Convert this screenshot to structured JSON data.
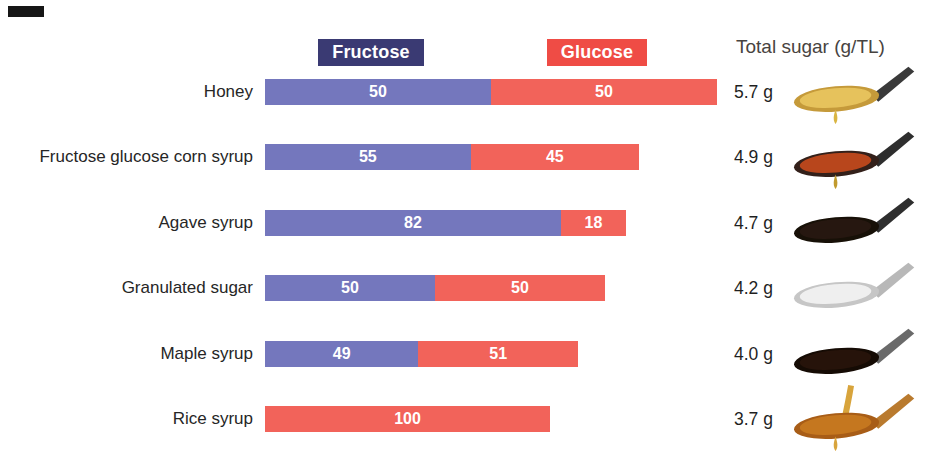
{
  "legend": {
    "fructose_label": "Fructose",
    "glucose_label": "Glucose"
  },
  "header": {
    "total_sugar_label": "Total sugar (g/TL)"
  },
  "colors": {
    "background": "#ffffff",
    "bar_fructose": "#7477bd",
    "bar_glucose": "#f2635a",
    "legend_fructose": "#3a3a73",
    "legend_glucose": "#ef4c45",
    "bar_value_text": "#ffffff",
    "category_text": "#262626",
    "total_text": "#1f1f1f",
    "header_text": "#474340"
  },
  "chart_data": {
    "type": "bar",
    "variant": "horizontal-stacked-100pct",
    "title": "",
    "legend_entries": [
      "Fructose",
      "Glucose"
    ],
    "legend_position": "top",
    "grid": false,
    "unit": "percent of sugar composition",
    "categories": [
      "Honey",
      "Fructose glucose corn syrup",
      "Agave syrup",
      "Granulated sugar",
      "Maple syrup",
      "Rice syrup"
    ],
    "series": [
      {
        "name": "Fructose",
        "values": [
          50,
          55,
          82,
          50,
          49,
          0
        ]
      },
      {
        "name": "Glucose",
        "values": [
          50,
          45,
          18,
          50,
          51,
          100
        ]
      }
    ],
    "totals": {
      "label": "Total sugar (g/TL)",
      "values": [
        5.7,
        4.9,
        4.7,
        4.2,
        4.0,
        3.7
      ]
    },
    "bar_width_note": "bar total length is proportional to total sugar per teaspoon",
    "rows": [
      {
        "label": "Honey",
        "fructose": 50,
        "glucose": 50,
        "fructose_label": "50",
        "glucose_label": "50",
        "total_label": "5.7 g",
        "spoon": "honey-spoon",
        "spoon_colors": {
          "pour": null,
          "handle": "#3a3a3a",
          "rim": "#c59a3a",
          "content": "#e6c25c",
          "drip": "#d9b542"
        }
      },
      {
        "label": "Fructose glucose corn syrup",
        "fructose": 55,
        "glucose": 45,
        "fructose_label": "55",
        "glucose_label": "45",
        "total_label": "4.9 g",
        "spoon": "corn-syrup-spoon",
        "spoon_colors": {
          "pour": null,
          "handle": "#2e2e2e",
          "rim": "#33201a",
          "content": "#b8461c",
          "drip": "#c19a2e"
        }
      },
      {
        "label": "Agave syrup",
        "fructose": 82,
        "glucose": 18,
        "fructose_label": "82",
        "glucose_label": "18",
        "total_label": "4.7 g",
        "spoon": "agave-syrup-spoon",
        "spoon_colors": {
          "pour": null,
          "handle": "#2e2e2e",
          "rim": "#171007",
          "content": "#261710",
          "drip": null
        }
      },
      {
        "label": "Granulated sugar",
        "fructose": 50,
        "glucose": 50,
        "fructose_label": "50",
        "glucose_label": "50",
        "total_label": "4.2 g",
        "spoon": "granulated-sugar-spoon",
        "spoon_colors": {
          "pour": null,
          "handle": "#b8b8b8",
          "rim": "#c6c6c6",
          "content": "#efefef",
          "drip": null
        }
      },
      {
        "label": "Maple syrup",
        "fructose": 49,
        "glucose": 51,
        "fructose_label": "49",
        "glucose_label": "51",
        "total_label": "4.0 g",
        "spoon": "maple-syrup-spoon",
        "spoon_colors": {
          "pour": null,
          "handle": "#6a6a6a",
          "rim": "#150b04",
          "content": "#26130a",
          "drip": null
        }
      },
      {
        "label": "Rice syrup",
        "fructose": 0,
        "glucose": 100,
        "fructose_label": "",
        "glucose_label": "100",
        "total_label": "3.7 g",
        "spoon": "rice-syrup-spoon",
        "spoon_colors": {
          "pour": "#d8a43c",
          "handle": "#b97a2e",
          "rim": "#a85d17",
          "content": "#c5771f",
          "drip": "#d8a43c"
        }
      }
    ],
    "layout": {
      "bar_left_px": 265,
      "bar_height_px": 26,
      "first_bar_top_px": 79,
      "row_pitch_px": 65.4,
      "bar_widths_px": [
        452,
        374,
        361,
        340,
        313,
        285
      ]
    }
  }
}
